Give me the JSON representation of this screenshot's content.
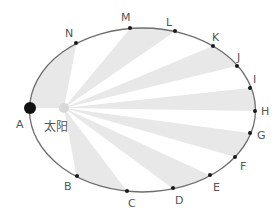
{
  "diagram": {
    "title": "",
    "sun_label": "太阳",
    "colors": {
      "orbit": "#6e6e6e",
      "wedge": "#e8e8e8",
      "point": "#1a1a1a",
      "planet": "#111111",
      "sun": "#d9d9d9",
      "label": "#555555"
    },
    "ellipse": {
      "cx": 142.5,
      "cy": 110,
      "rx": 113,
      "ry": 82
    },
    "sun": {
      "x": 64,
      "y": 108,
      "r": 5
    },
    "planet": {
      "label": "A",
      "x": 30,
      "y": 108,
      "r": 6
    },
    "points": [
      {
        "label": "A",
        "x": 30,
        "y": 108,
        "lx": 16,
        "ly": 128
      },
      {
        "label": "B",
        "x": 77,
        "y": 176,
        "lx": 64,
        "ly": 190
      },
      {
        "label": "C",
        "x": 127,
        "y": 191,
        "lx": 128,
        "ly": 207
      },
      {
        "label": "D",
        "x": 173,
        "y": 188,
        "lx": 175,
        "ly": 204
      },
      {
        "label": "E",
        "x": 210,
        "y": 175,
        "lx": 213,
        "ly": 191
      },
      {
        "label": "F",
        "x": 235,
        "y": 157,
        "lx": 240,
        "ly": 170
      },
      {
        "label": "G",
        "x": 250,
        "y": 133,
        "lx": 257,
        "ly": 139
      },
      {
        "label": "H",
        "x": 255,
        "y": 111,
        "lx": 261,
        "ly": 115
      },
      {
        "label": "I",
        "x": 250,
        "y": 88,
        "lx": 253,
        "ly": 83
      },
      {
        "label": "J",
        "x": 237,
        "y": 66,
        "lx": 237,
        "ly": 61
      },
      {
        "label": "K",
        "x": 213,
        "y": 46,
        "lx": 212,
        "ly": 41
      },
      {
        "label": "L",
        "x": 175,
        "y": 31,
        "lx": 166,
        "ly": 26
      },
      {
        "label": "M",
        "x": 130,
        "y": 28,
        "lx": 121,
        "ly": 21
      },
      {
        "label": "N",
        "x": 76,
        "y": 43,
        "lx": 65,
        "ly": 37
      }
    ],
    "wedges": [
      [
        "A",
        "N"
      ],
      [
        "M",
        "L"
      ],
      [
        "K",
        "J"
      ],
      [
        "I",
        "H"
      ],
      [
        "G",
        "F"
      ],
      [
        "E",
        "D"
      ],
      [
        "C",
        "B"
      ]
    ]
  }
}
